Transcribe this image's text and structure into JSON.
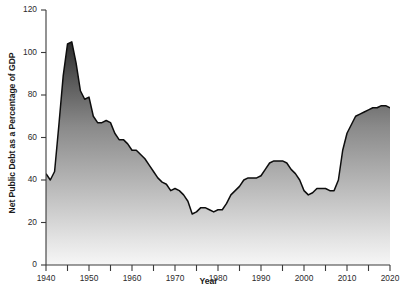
{
  "chart_data": {
    "type": "area",
    "title": "",
    "xlabel": "Year",
    "ylabel": "Net Public Debt as a Percentage of GDP",
    "xlim": [
      1940,
      2020
    ],
    "ylim": [
      0,
      120
    ],
    "grid": "horizontal-white-gridlines",
    "legend": "none",
    "fill_style": "vertical gradient, dark gray at top to near-white at bottom",
    "ytick_labels": [
      "0",
      "20",
      "40",
      "60",
      "80",
      "100",
      "120"
    ],
    "ytick_values": [
      0,
      20,
      40,
      60,
      80,
      100,
      120
    ],
    "xtick_labels": [
      "1940",
      "1950",
      "1960",
      "1970",
      "1980",
      "1990",
      "2000",
      "2010",
      "2020"
    ],
    "xtick_values": [
      1940,
      1950,
      1960,
      1970,
      1980,
      1990,
      2000,
      2010,
      2020
    ],
    "xtick_minor_values": [
      1945,
      1955,
      1965,
      1975,
      1985,
      1995,
      2005,
      2015
    ],
    "x": [
      1940,
      1941,
      1942,
      1943,
      1944,
      1945,
      1946,
      1947,
      1948,
      1949,
      1950,
      1951,
      1952,
      1953,
      1954,
      1955,
      1956,
      1957,
      1958,
      1959,
      1960,
      1961,
      1962,
      1963,
      1964,
      1965,
      1966,
      1967,
      1968,
      1969,
      1970,
      1971,
      1972,
      1973,
      1974,
      1975,
      1976,
      1977,
      1978,
      1979,
      1980,
      1981,
      1982,
      1983,
      1984,
      1985,
      1986,
      1987,
      1988,
      1989,
      1990,
      1991,
      1992,
      1993,
      1994,
      1995,
      1996,
      1997,
      1998,
      1999,
      2000,
      2001,
      2002,
      2003,
      2004,
      2005,
      2006,
      2007,
      2008,
      2009,
      2010,
      2011,
      2012,
      2013,
      2014,
      2015,
      2016,
      2017,
      2018,
      2019,
      2020
    ],
    "values": [
      43,
      40,
      44,
      66,
      89,
      104,
      105,
      95,
      82,
      78,
      79,
      70,
      67,
      67,
      68,
      67,
      62,
      59,
      59,
      57,
      54,
      54,
      52,
      50,
      47,
      44,
      41,
      39,
      38,
      35,
      36,
      35,
      33,
      30,
      24,
      25,
      27,
      27,
      26,
      25,
      26,
      26,
      29,
      33,
      35,
      37,
      40,
      41,
      41,
      41,
      42,
      45,
      48,
      49,
      49,
      49,
      48,
      45,
      43,
      40,
      35,
      33,
      34,
      36,
      36,
      36,
      35,
      35,
      40,
      54,
      62,
      66,
      70,
      71,
      72,
      73,
      74,
      74,
      75,
      75,
      74
    ],
    "peak_annotation": {
      "year": 1946,
      "value": 105
    },
    "trough_annotation": {
      "year": 1974,
      "value": 24
    },
    "colors": {
      "area_top": "#303030",
      "area_bottom": "#f4f4f4",
      "line": "#0d0d0d",
      "gridline": "#ffffff",
      "axis": "#3a3a3a",
      "text": "#1a1a1a",
      "background": "#ffffff"
    }
  }
}
